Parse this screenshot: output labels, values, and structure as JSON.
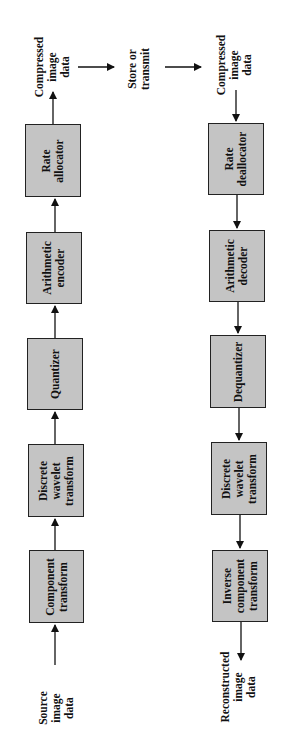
{
  "diagram": {
    "orientation": "rotated 90 degrees counter-clockwise",
    "encoder": {
      "input_label": [
        "Source",
        "image",
        "data"
      ],
      "blocks": [
        {
          "id": "component-transform",
          "lines": [
            "Component",
            "transform"
          ]
        },
        {
          "id": "discrete-wavelet-transform",
          "lines": [
            "Discrete",
            "wavelet",
            "transform"
          ]
        },
        {
          "id": "quantizer",
          "lines": [
            "Quantizer"
          ]
        },
        {
          "id": "arithmetic-encoder",
          "lines": [
            "Arithmetic",
            "encoder"
          ]
        },
        {
          "id": "rate-allocator",
          "lines": [
            "Rate",
            "allocator"
          ]
        }
      ],
      "output_label": [
        "Compressed",
        "image",
        "data"
      ]
    },
    "channel": {
      "label": [
        "Store or",
        "transmit"
      ]
    },
    "decoder": {
      "input_label": [
        "Compressed",
        "image",
        "data"
      ],
      "blocks": [
        {
          "id": "rate-deallocator",
          "lines": [
            "Rate",
            "deallocator"
          ]
        },
        {
          "id": "arithmetic-decoder",
          "lines": [
            "Arithmetic",
            "decoder"
          ]
        },
        {
          "id": "dequantizer",
          "lines": [
            "Dequantizer"
          ]
        },
        {
          "id": "discrete-wavelet-transform-inverse",
          "lines": [
            "Discrete",
            "wavelet",
            "transform"
          ]
        },
        {
          "id": "inverse-component-transform",
          "lines": [
            "Inverse",
            "component",
            "transform"
          ]
        }
      ],
      "output_label": [
        "Reconstructed",
        "image",
        "data"
      ]
    },
    "colors": {
      "block_fill": "#c4c4c4",
      "block_border": "#222222",
      "arrow": "#111111",
      "background": "#ffffff"
    }
  }
}
